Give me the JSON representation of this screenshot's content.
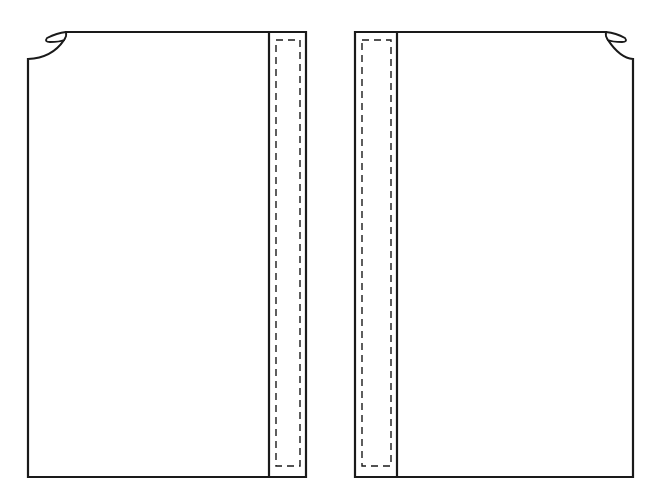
{
  "diagram": {
    "type": "sewing-pattern",
    "colors": {
      "background": "#ffffff",
      "line": "#1a1a1a"
    },
    "pieces": [
      {
        "id": "left-front",
        "facing_side": "right",
        "neck_notch_side": "left"
      },
      {
        "id": "right-front",
        "facing_side": "left",
        "neck_notch_side": "right"
      }
    ]
  }
}
